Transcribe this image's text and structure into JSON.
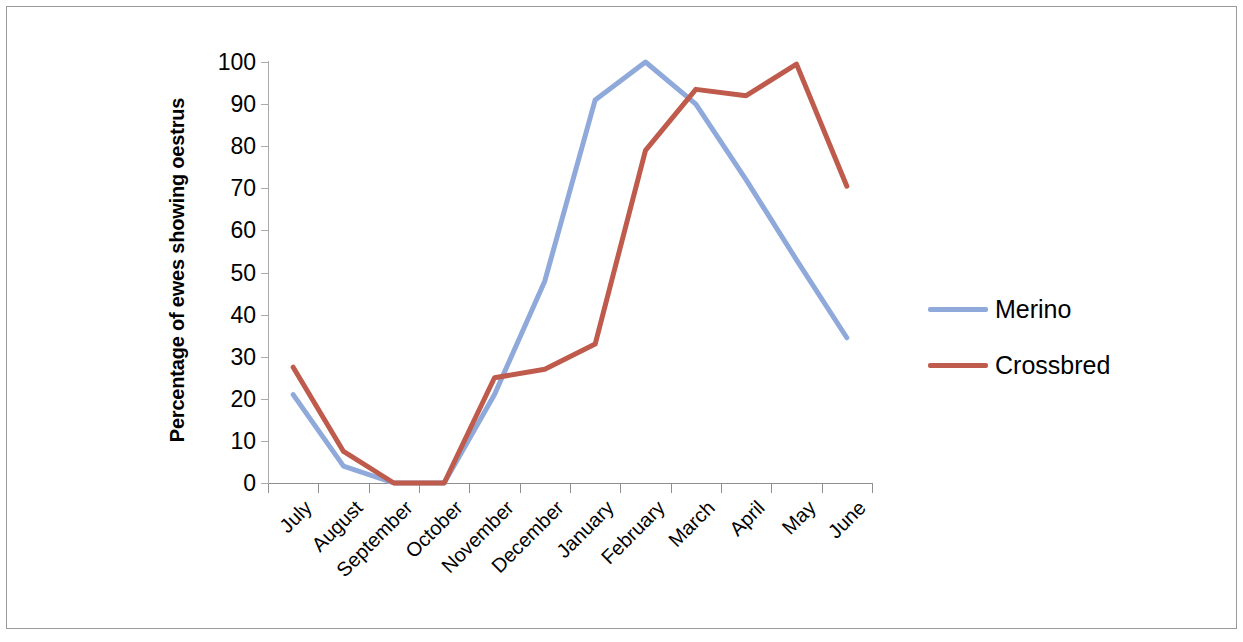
{
  "chart_data": {
    "type": "line",
    "title": "",
    "xlabel": "",
    "ylabel": "Percentage of ewes showing oestrus",
    "categories": [
      "July",
      "August",
      "September",
      "October",
      "November",
      "December",
      "January",
      "February",
      "March",
      "April",
      "May",
      "June"
    ],
    "series": [
      {
        "name": "Merino",
        "color": "#8FA9DA",
        "values": [
          21,
          4,
          0,
          0,
          21,
          48,
          91,
          100,
          90,
          72,
          53,
          34.5
        ]
      },
      {
        "name": "Crossbred",
        "color": "#BE5B4C",
        "values": [
          27.5,
          7.5,
          0,
          0,
          25,
          27,
          33,
          79,
          93.5,
          92,
          99.5,
          70.5
        ]
      }
    ],
    "ylim": [
      0,
      100
    ],
    "y_ticks": [
      0,
      10,
      20,
      30,
      40,
      50,
      60,
      70,
      80,
      90,
      100
    ],
    "y_tick_labels": [
      "0",
      "10",
      "20",
      "30",
      "40",
      "50",
      "60",
      "70",
      "80",
      "90",
      "100"
    ],
    "grid": false,
    "legend_position": "right",
    "x_label_rotation": -45
  },
  "legend": {
    "entries": [
      {
        "label": "Merino",
        "color": "#8FA9DA"
      },
      {
        "label": "Crossbred",
        "color": "#BE5B4C"
      }
    ]
  }
}
